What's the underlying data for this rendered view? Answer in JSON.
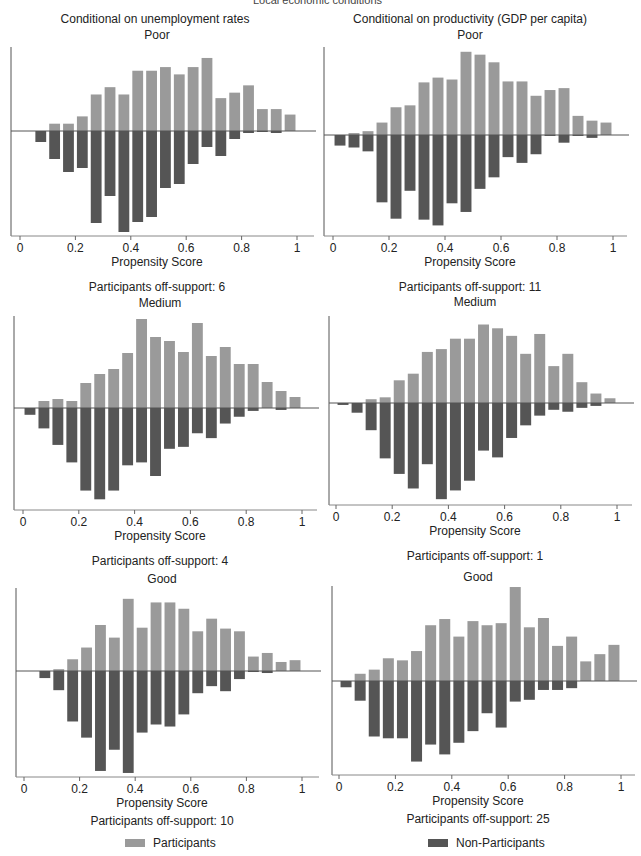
{
  "figure": {
    "top_title": "Local economic conditions",
    "column_titles": [
      "Conditional on unemployment rates",
      "Conditional on productivity (GDP per capita)"
    ],
    "x_label": "Propensity Score",
    "x_ticks": [
      "0",
      "0.2",
      "0.4",
      "0.6",
      "0.8",
      "1"
    ],
    "legend": {
      "participants": "Participants",
      "non_participants": "Non-Participants"
    },
    "colors": {
      "participants": "#9a9a9a",
      "non_participants": "#555555",
      "axis": "#555555"
    }
  },
  "panels": [
    {
      "id": "p1",
      "row_title": "Poor",
      "off_support": "Participants off-support: 6"
    },
    {
      "id": "p2",
      "row_title": "Poor",
      "off_support": "Participants off-support: 11"
    },
    {
      "id": "p3",
      "row_title": "Medium",
      "off_support": "Participants off-support: 4"
    },
    {
      "id": "p4",
      "row_title": "Medium",
      "off_support": "Participants off-support: 1"
    },
    {
      "id": "p5",
      "row_title": "Good",
      "off_support": "Participants off-support: 10"
    },
    {
      "id": "p6",
      "row_title": "Good",
      "off_support": "Participants off-support: 25"
    }
  ],
  "chart_data": [
    {
      "type": "bar",
      "title": "Conditional on unemployment rates — Poor",
      "xlabel": "Propensity Score",
      "ylabel": "",
      "xlim": [
        0,
        1
      ],
      "bin_centers": [
        0.075,
        0.125,
        0.175,
        0.225,
        0.275,
        0.325,
        0.375,
        0.425,
        0.475,
        0.525,
        0.575,
        0.625,
        0.675,
        0.725,
        0.775,
        0.825,
        0.875,
        0.925,
        0.975
      ],
      "series": [
        {
          "name": "Participants",
          "values": [
            0,
            8,
            8,
            16,
            40,
            48,
            40,
            66,
            66,
            70,
            62,
            70,
            80,
            36,
            42,
            50,
            24,
            24,
            18
          ]
        },
        {
          "name": "Non-Participants",
          "values": [
            -11,
            -28,
            -41,
            -37,
            -92,
            -65,
            -101,
            -91,
            -86,
            -57,
            -53,
            -33,
            -16,
            -25,
            -8,
            -2,
            -1,
            -2,
            0
          ]
        }
      ],
      "note": "Participants off-support: 6"
    },
    {
      "type": "bar",
      "title": "Conditional on productivity (GDP per capita) — Poor",
      "xlabel": "Propensity Score",
      "ylabel": "",
      "xlim": [
        0,
        1
      ],
      "bin_centers": [
        0.025,
        0.075,
        0.125,
        0.175,
        0.225,
        0.275,
        0.325,
        0.375,
        0.425,
        0.475,
        0.525,
        0.575,
        0.625,
        0.675,
        0.725,
        0.775,
        0.825,
        0.875,
        0.925,
        0.975
      ],
      "series": [
        {
          "name": "Participants",
          "values": [
            0,
            2,
            4,
            13,
            29,
            31,
            55,
            60,
            58,
            87,
            84,
            76,
            56,
            56,
            41,
            47,
            49,
            20,
            15,
            13
          ]
        },
        {
          "name": "Non-Participants",
          "values": [
            -11,
            -13,
            -17,
            -70,
            -87,
            -58,
            -88,
            -94,
            -71,
            -80,
            -56,
            -44,
            -23,
            -29,
            -20,
            -1,
            -8,
            -1,
            -3,
            0
          ]
        }
      ],
      "note": "Participants off-support: 11"
    },
    {
      "type": "bar",
      "title": "Conditional on unemployment rates — Medium",
      "xlabel": "Propensity Score",
      "ylabel": "",
      "xlim": [
        0,
        1
      ],
      "bin_centers": [
        0.025,
        0.075,
        0.125,
        0.175,
        0.225,
        0.275,
        0.325,
        0.375,
        0.425,
        0.475,
        0.525,
        0.575,
        0.625,
        0.675,
        0.725,
        0.775,
        0.825,
        0.875,
        0.925,
        0.975
      ],
      "series": [
        {
          "name": "Participants",
          "values": [
            0,
            7,
            9,
            7,
            25,
            34,
            39,
            55,
            89,
            71,
            67,
            56,
            85,
            52,
            61,
            44,
            44,
            26,
            17,
            11
          ]
        },
        {
          "name": "Non-Participants",
          "values": [
            -7,
            -21,
            -38,
            -56,
            -85,
            -94,
            -85,
            -59,
            -56,
            -70,
            -42,
            -40,
            -26,
            -31,
            -16,
            -9,
            -3,
            0,
            -2,
            0
          ]
        }
      ],
      "note": "Participants off-support: 4"
    },
    {
      "type": "bar",
      "title": "Conditional on productivity (GDP per capita) — Medium",
      "xlabel": "Propensity Score",
      "ylabel": "",
      "xlim": [
        0,
        1
      ],
      "bin_centers": [
        0.025,
        0.075,
        0.125,
        0.175,
        0.225,
        0.275,
        0.325,
        0.375,
        0.425,
        0.475,
        0.525,
        0.575,
        0.625,
        0.675,
        0.725,
        0.775,
        0.825,
        0.875,
        0.925,
        0.975
      ],
      "series": [
        {
          "name": "Participants",
          "values": [
            0,
            0,
            4,
            6,
            24,
            31,
            54,
            57,
            68,
            68,
            83,
            79,
            71,
            52,
            73,
            39,
            52,
            22,
            10,
            5
          ]
        },
        {
          "name": "Non-Participants",
          "values": [
            -2,
            -10,
            -28,
            -57,
            -73,
            -88,
            -63,
            -99,
            -90,
            -80,
            -49,
            -56,
            -36,
            -23,
            -13,
            -7,
            -9,
            -5,
            -3,
            0
          ]
        }
      ],
      "note": "Participants off-support: 1"
    },
    {
      "type": "bar",
      "title": "Conditional on unemployment rates — Good",
      "xlabel": "Propensity Score",
      "ylabel": "",
      "xlim": [
        0,
        1
      ],
      "bin_centers": [
        0.075,
        0.125,
        0.175,
        0.225,
        0.275,
        0.325,
        0.375,
        0.425,
        0.475,
        0.525,
        0.575,
        0.625,
        0.675,
        0.725,
        0.775,
        0.825,
        0.875,
        0.925,
        0.975
      ],
      "series": [
        {
          "name": "Participants",
          "values": [
            0,
            2,
            13,
            26,
            51,
            37,
            80,
            48,
            76,
            76,
            69,
            44,
            58,
            47,
            44,
            16,
            20,
            10,
            12
          ]
        },
        {
          "name": "Non-Participants",
          "values": [
            -7,
            -19,
            -50,
            -66,
            -99,
            -78,
            -101,
            -61,
            -53,
            -55,
            -43,
            -22,
            -15,
            -20,
            -8,
            -1,
            -2,
            0,
            0
          ]
        }
      ],
      "note": "Participants off-support: 10"
    },
    {
      "type": "bar",
      "title": "Conditional on productivity (GDP per capita) — Good",
      "xlabel": "Propensity Score",
      "ylabel": "",
      "xlim": [
        0,
        1
      ],
      "bin_centers": [
        0.025,
        0.075,
        0.125,
        0.175,
        0.225,
        0.275,
        0.325,
        0.375,
        0.425,
        0.475,
        0.525,
        0.575,
        0.625,
        0.675,
        0.725,
        0.775,
        0.825,
        0.875,
        0.925,
        0.975
      ],
      "series": [
        {
          "name": "Participants",
          "values": [
            0,
            7,
            11,
            22,
            20,
            29,
            54,
            60,
            43,
            58,
            54,
            56,
            91,
            52,
            61,
            34,
            43,
            19,
            26,
            35
          ]
        },
        {
          "name": "Non-Participants",
          "values": [
            -7,
            -22,
            -62,
            -64,
            -64,
            -90,
            -71,
            -82,
            -69,
            -56,
            -36,
            -52,
            -23,
            -21,
            -10,
            -10,
            -8,
            0,
            0,
            0
          ]
        }
      ],
      "note": "Participants off-support: 25"
    }
  ]
}
